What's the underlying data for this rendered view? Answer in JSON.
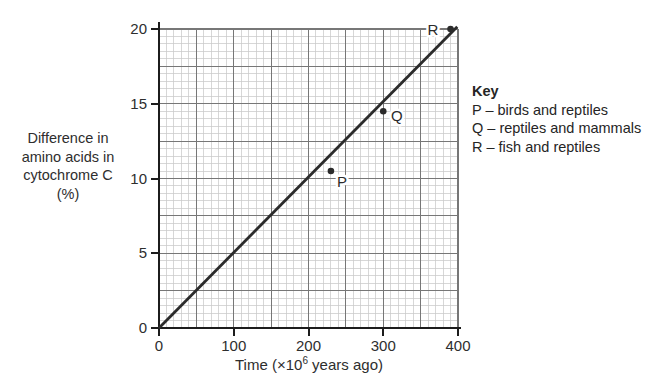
{
  "figure": {
    "ylabel_lines": [
      "Difference in",
      "amino acids in",
      "cytochrome C",
      "(%)"
    ],
    "xlabel": {
      "prefix": "Time (×10",
      "superscript": "6",
      "suffix": " years ago)"
    },
    "key": {
      "title": "Key",
      "items": [
        "P – birds and reptiles",
        "Q – reptiles and mammals",
        "R – fish and reptiles"
      ]
    }
  },
  "chart_data": {
    "type": "line",
    "title": "",
    "xlabel": "Time (×10⁶ years ago)",
    "ylabel": "Difference in amino acids in cytochrome C (%)",
    "xlim": [
      0,
      400
    ],
    "ylim": [
      0,
      20
    ],
    "x_ticks": [
      "0",
      "100",
      "200",
      "300",
      "400"
    ],
    "x_tick_values": [
      0,
      100,
      200,
      300,
      400
    ],
    "y_ticks": [
      "0",
      "5",
      "10",
      "15",
      "20"
    ],
    "y_tick_values": [
      0,
      5,
      10,
      15,
      20
    ],
    "grid": {
      "on": true,
      "minor_step_x": 10,
      "minor_step_y": 0.5,
      "major_step_x": 50,
      "major_step_y": 2.5
    },
    "series": [
      {
        "name": "best-fit line",
        "style": "line",
        "x": [
          0,
          399
        ],
        "y": [
          0,
          20.15
        ]
      }
    ],
    "points": [
      {
        "label": "P",
        "x": 230,
        "y": 10.5,
        "label_dx": 11,
        "label_dy": 11
      },
      {
        "label": "Q",
        "x": 300,
        "y": 14.5,
        "label_dx": 13.5,
        "label_dy": 5
      },
      {
        "label": "R",
        "x": 390,
        "y": 20,
        "label_dx": -17.5,
        "label_dy": 1
      }
    ],
    "legend_position": "right",
    "colors": {
      "line": "#2b2b2b",
      "point": "#2b2b2b",
      "axis": "#1c1c1c",
      "major_grid": "#777777",
      "minor_grid": "#c9c9c9",
      "text": "#2e2e2e",
      "background": "#ffffff"
    }
  }
}
